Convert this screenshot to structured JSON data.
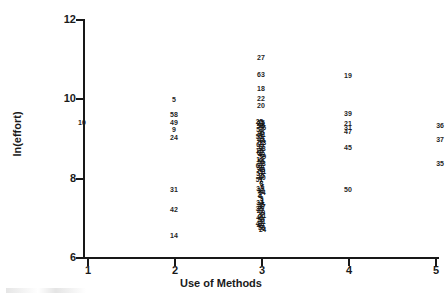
{
  "chart_data": {
    "type": "scatter",
    "title": "",
    "xlabel": "Use of Methods",
    "ylabel": "ln(effort)",
    "xlim": [
      1,
      5
    ],
    "ylim": [
      6,
      12
    ],
    "xticks": [
      "1",
      "2",
      "3",
      "4",
      "5"
    ],
    "yticks": [
      "6",
      "8",
      "10",
      "12"
    ],
    "grid": false,
    "legend": null,
    "point_label_mode": "case-number",
    "points": [
      {
        "label": "10",
        "x": 1.0,
        "y": 9.4
      },
      {
        "label": "5",
        "x": 2.0,
        "y": 9.98
      },
      {
        "label": "58",
        "x": 2.0,
        "y": 9.6
      },
      {
        "label": "49",
        "x": 2.0,
        "y": 9.4
      },
      {
        "label": "9",
        "x": 2.0,
        "y": 9.22
      },
      {
        "label": "24",
        "x": 2.0,
        "y": 9.02
      },
      {
        "label": "31",
        "x": 2.0,
        "y": 7.72
      },
      {
        "label": "42",
        "x": 2.0,
        "y": 7.22
      },
      {
        "label": "14",
        "x": 2.0,
        "y": 6.55
      },
      {
        "label": "27",
        "x": 3.0,
        "y": 11.05
      },
      {
        "label": "63",
        "x": 3.0,
        "y": 10.62
      },
      {
        "label": "18",
        "x": 3.0,
        "y": 10.27
      },
      {
        "label": "22",
        "x": 3.0,
        "y": 10.02
      },
      {
        "label": "20",
        "x": 3.0,
        "y": 9.83
      },
      {
        "label": "25",
        "x": 3.0,
        "y": 9.4
      },
      {
        "label": "19",
        "x": 4.0,
        "y": 10.6
      },
      {
        "label": "39",
        "x": 4.0,
        "y": 9.63
      },
      {
        "label": "21",
        "x": 4.0,
        "y": 9.38
      },
      {
        "label": "31",
        "x": 4.0,
        "y": 9.28
      },
      {
        "label": "47",
        "x": 4.0,
        "y": 9.18
      },
      {
        "label": "45",
        "x": 4.0,
        "y": 8.78
      },
      {
        "label": "50",
        "x": 4.0,
        "y": 7.72
      },
      {
        "label": "36",
        "x": 5.0,
        "y": 9.33
      },
      {
        "label": "37",
        "x": 5.0,
        "y": 8.98
      },
      {
        "label": "35",
        "x": 5.0,
        "y": 8.38
      }
    ],
    "dense_cluster": {
      "x": 3.0,
      "y_range": [
        6.68,
        9.4
      ],
      "note": "overlapping case-number labels, individually illegible",
      "labels": [
        "25",
        "23",
        "26",
        "56",
        "52",
        "46",
        "41",
        "53",
        "29",
        "44",
        "13",
        "60",
        "17",
        "38",
        "16",
        "62",
        "43",
        "59",
        "12",
        "55",
        "28",
        "61",
        "30",
        "48",
        "11",
        "57",
        "15",
        "40",
        "51",
        "7",
        "8",
        "6",
        "33",
        "32",
        "54",
        "2",
        "4",
        "3",
        "1",
        "34",
        "36",
        "37",
        "35",
        "22",
        "19",
        "21",
        "45",
        "50",
        "31",
        "42",
        "49",
        "58",
        "24"
      ]
    }
  },
  "annotations": {
    "axis_title_x": "Use of Methods",
    "axis_title_y": "ln(effort)"
  }
}
